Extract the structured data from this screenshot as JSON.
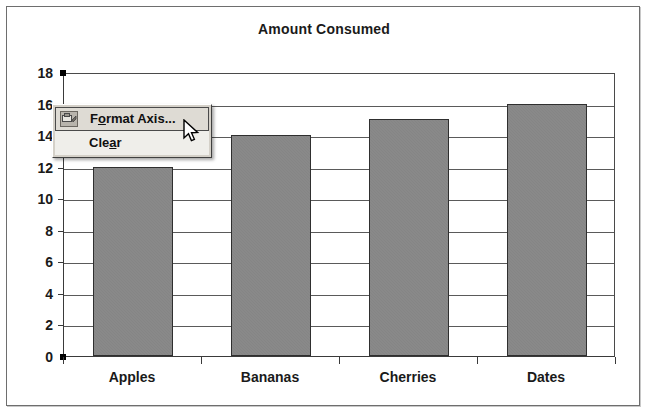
{
  "chart_data": {
    "type": "bar",
    "title": "Amount Consumed",
    "xlabel": "",
    "ylabel": "",
    "categories": [
      "Apples",
      "Bananas",
      "Cherries",
      "Dates"
    ],
    "values": [
      12,
      14,
      15,
      16
    ],
    "ylim": [
      0,
      18
    ],
    "ytick_labels": [
      "18",
      "16",
      "14",
      "12",
      "10",
      "8",
      "6",
      "4",
      "2",
      "0"
    ],
    "ytick_values": [
      18,
      16,
      14,
      12,
      10,
      8,
      6,
      4,
      2,
      0
    ],
    "ytick_interval": 2,
    "grid": true,
    "legend": false,
    "legend_position": "none",
    "series": [
      {
        "name": "Amount Consumed",
        "values": [
          12,
          14,
          15,
          16
        ]
      }
    ],
    "bar_fill_color": "#858585",
    "bar_border_color": "#2f2f2f",
    "plot_background_color": "#ffffff",
    "axis_color": "#3a3a3a"
  },
  "chart": {
    "title": "Amount Consumed",
    "value_axis_selected": true,
    "selection_handle_color": "#000000"
  },
  "context_menu": {
    "items": [
      {
        "label": "Format Axis...",
        "accel_before": "F",
        "accel_char": "o",
        "accel_after": "rmat Axis...",
        "selected": true,
        "has_icon": true,
        "icon": "format-axis-icon"
      },
      {
        "label": "Clear",
        "accel_before": "Cle",
        "accel_char": "a",
        "accel_after": "r",
        "selected": false,
        "has_icon": false,
        "icon": ""
      }
    ],
    "background_color": "#d4d0c8",
    "item_background_color": "#efeeea",
    "selected_background_color": "#dedbd4"
  },
  "cursor": {
    "type": "arrow-pointer"
  }
}
